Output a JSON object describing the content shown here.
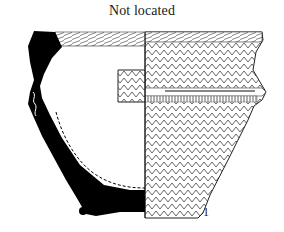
{
  "figure": {
    "title": "Not located",
    "number_label": "1",
    "colors": {
      "ink": "#000000",
      "hatch": "#6b6b6b",
      "background": "#ffffff"
    },
    "elements": [
      {
        "name": "section-profile",
        "fill": "black",
        "side": "left"
      },
      {
        "name": "interior-dashed-line",
        "style": "dashed"
      },
      {
        "name": "exterior-decoration",
        "pattern": "herringbone",
        "side": "right"
      },
      {
        "name": "lug-handle",
        "position": "center-left of axis"
      },
      {
        "name": "carination-ridge",
        "position": "shoulder"
      },
      {
        "name": "scale-dot"
      }
    ]
  }
}
